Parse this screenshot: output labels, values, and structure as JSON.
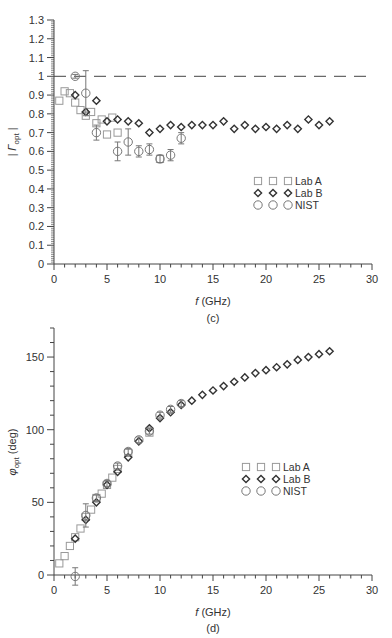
{
  "chart_data": [
    {
      "id": "c",
      "type": "scatter",
      "caption": "(c)",
      "title": "",
      "xlabel": "f (GHz)",
      "ylabel": "|Γopt|",
      "xlim": [
        0,
        30
      ],
      "ylim": [
        0,
        1.3
      ],
      "xticks": [
        0,
        5,
        10,
        15,
        20,
        25,
        30
      ],
      "yticks": [
        0,
        0.1,
        0.2,
        0.3,
        0.4,
        0.5,
        0.6,
        0.7,
        0.8,
        0.9,
        1,
        1.1,
        1.2,
        1.3
      ],
      "ytick_labels": [
        "0",
        "0.1",
        "0.2",
        "0.3",
        "0.4",
        "0.5",
        "0.6",
        "0.7",
        "0.8",
        "0.9",
        "1",
        "1.1",
        "1.2",
        "1.3"
      ],
      "grid": false,
      "reference_line": {
        "y": 1.0,
        "style": "dashed"
      },
      "legend": {
        "position": "center-right",
        "entries": [
          "Lab A",
          "Lab B",
          "NIST"
        ]
      },
      "series": [
        {
          "name": "Lab A",
          "marker": "square",
          "color": "#999999",
          "points": [
            [
              0.5,
              0.87
            ],
            [
              1,
              0.92
            ],
            [
              1.5,
              0.91
            ],
            [
              2,
              0.86
            ],
            [
              2.5,
              0.82
            ],
            [
              3,
              0.79
            ],
            [
              3.5,
              0.81
            ],
            [
              4,
              0.75
            ],
            [
              4.5,
              0.77
            ],
            [
              5,
              0.69
            ],
            [
              5.5,
              0.78
            ],
            [
              6,
              0.7
            ],
            [
              10,
              0.56
            ]
          ]
        },
        {
          "name": "Lab B",
          "marker": "diamond",
          "color": "#333333",
          "points": [
            [
              2,
              0.9
            ],
            [
              3,
              0.81
            ],
            [
              4,
              0.87
            ],
            [
              5,
              0.76
            ],
            [
              6,
              0.77
            ],
            [
              7,
              0.76
            ],
            [
              8,
              0.75
            ],
            [
              9,
              0.7
            ],
            [
              10,
              0.72
            ],
            [
              11,
              0.74
            ],
            [
              12,
              0.73
            ],
            [
              13,
              0.74
            ],
            [
              14,
              0.74
            ],
            [
              15,
              0.74
            ],
            [
              16,
              0.76
            ],
            [
              17,
              0.72
            ],
            [
              18,
              0.74
            ],
            [
              19,
              0.72
            ],
            [
              20,
              0.73
            ],
            [
              21,
              0.72
            ],
            [
              22,
              0.74
            ],
            [
              23,
              0.72
            ],
            [
              24,
              0.77
            ],
            [
              25,
              0.74
            ],
            [
              26,
              0.76
            ]
          ]
        },
        {
          "name": "NIST",
          "marker": "circle",
          "color": "#777777",
          "points": [
            [
              2,
              1.0,
              0.01
            ],
            [
              3,
              0.91,
              0.12
            ],
            [
              4,
              0.7,
              0.04
            ],
            [
              6,
              0.6,
              0.05
            ],
            [
              7,
              0.65,
              0.07
            ],
            [
              8,
              0.6,
              0.03
            ],
            [
              9,
              0.61,
              0.03
            ],
            [
              10,
              0.56,
              0.02
            ],
            [
              11,
              0.58,
              0.03
            ],
            [
              12,
              0.67,
              0.03
            ]
          ]
        }
      ]
    },
    {
      "id": "d",
      "type": "scatter",
      "caption": "(d)",
      "title": "",
      "xlabel": "f (GHz)",
      "ylabel": "φopt (deg)",
      "xlim": [
        0,
        30
      ],
      "ylim": [
        0,
        170
      ],
      "xticks": [
        0,
        5,
        10,
        15,
        20,
        25,
        30
      ],
      "yticks": [
        0,
        50,
        100,
        150
      ],
      "ytick_labels": [
        "0",
        "50",
        "100",
        "150"
      ],
      "grid": false,
      "legend": {
        "position": "center-right",
        "entries": [
          "Lab A",
          "Lab B",
          "NIST"
        ]
      },
      "series": [
        {
          "name": "Lab A",
          "marker": "square",
          "color": "#999999",
          "points": [
            [
              0.5,
              8
            ],
            [
              1,
              13
            ],
            [
              1.5,
              20
            ],
            [
              2,
              26
            ],
            [
              2.5,
              32
            ],
            [
              3,
              40
            ],
            [
              3.5,
              45
            ],
            [
              4,
              53
            ],
            [
              4.5,
              56
            ],
            [
              5,
              62
            ],
            [
              5.5,
              67
            ],
            [
              6,
              73
            ],
            [
              7,
              84
            ],
            [
              9,
              98
            ]
          ]
        },
        {
          "name": "Lab B",
          "marker": "diamond",
          "color": "#333333",
          "points": [
            [
              2,
              25
            ],
            [
              3,
              38
            ],
            [
              4,
              50
            ],
            [
              5,
              62
            ],
            [
              6,
              71
            ],
            [
              7,
              81
            ],
            [
              8,
              92
            ],
            [
              9,
              101
            ],
            [
              10,
              108
            ],
            [
              11,
              112
            ],
            [
              12,
              117
            ],
            [
              13,
              120
            ],
            [
              14,
              124
            ],
            [
              15,
              127
            ],
            [
              16,
              130
            ],
            [
              17,
              133
            ],
            [
              18,
              136
            ],
            [
              19,
              139
            ],
            [
              20,
              141
            ],
            [
              21,
              143
            ],
            [
              22,
              145
            ],
            [
              23,
              148
            ],
            [
              24,
              150
            ],
            [
              25,
              152
            ],
            [
              26,
              154
            ]
          ]
        },
        {
          "name": "NIST",
          "marker": "circle",
          "color": "#777777",
          "points": [
            [
              2,
              -1,
              6
            ],
            [
              3,
              41,
              8
            ],
            [
              4,
              53,
              2
            ],
            [
              5,
              63,
              2
            ],
            [
              6,
              75,
              2
            ],
            [
              7,
              85,
              2
            ],
            [
              8,
              93,
              2
            ],
            [
              9,
              99,
              2
            ],
            [
              10,
              110,
              2
            ],
            [
              11,
              114,
              2
            ],
            [
              12,
              118,
              2
            ]
          ]
        }
      ]
    }
  ],
  "figure": {
    "panel_c": {
      "caption": "(c)",
      "xlabel_italic": "f",
      "xlabel_rest": " (GHz)",
      "ylabel_main": "| Γ",
      "ylabel_sub": "opt",
      "ylabel_end": " |"
    },
    "panel_d": {
      "caption": "(d)",
      "xlabel_italic": "f",
      "xlabel_rest": " (GHz)",
      "ylabel_main": "φ",
      "ylabel_sub": "opt",
      "ylabel_end": " (deg)"
    },
    "legend_labels": [
      "Lab A",
      "Lab B",
      "NIST"
    ]
  }
}
